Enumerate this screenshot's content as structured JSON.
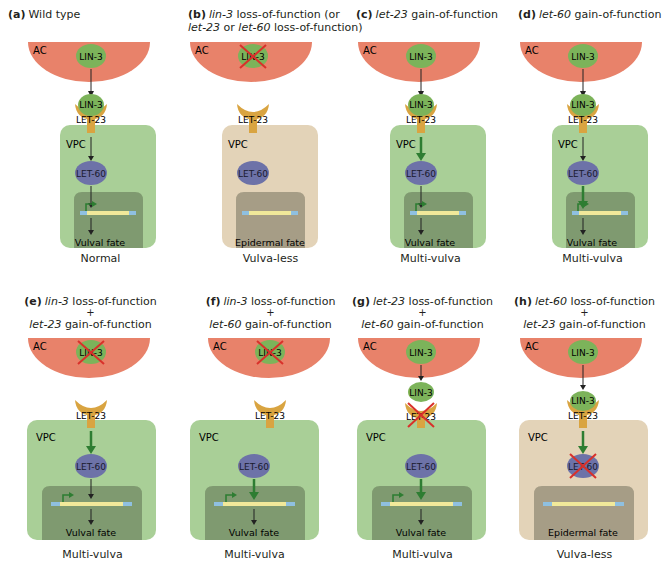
{
  "colors": {
    "ac_fill": "#e8826a",
    "lin3_fill": "#7cb35a",
    "let23_fill": "#d9a441",
    "let60_fill": "#6d72a8",
    "vpc_vulval": "#a9cf97",
    "vpc_epidermal": "#e3d3b8",
    "nucleus_vulval": "#7f9a70",
    "nucleus_epidermal": "#a69d86",
    "gene_bar": "#f1e99a",
    "gene_ends": "#8fc0e0",
    "promoter_arrow": "#2e7d32",
    "strong_arrow": "#2e7d32",
    "cross": "#d9302a"
  },
  "labels": {
    "ac": "AC",
    "vpc": "VPC",
    "lin3": "LIN-3",
    "let23": "LET-23",
    "let60": "LET-60",
    "plus": "+"
  },
  "panels": [
    {
      "id": "a",
      "letter": "(a)",
      "title_parts": [
        {
          "text": "Wild type",
          "italic": false
        }
      ],
      "fate": "Vulval fate",
      "outcome": "Normal"
    },
    {
      "id": "b",
      "letter": "(b)",
      "title_line1": [
        {
          "text": "lin-3",
          "italic": true
        },
        {
          "text": " loss-of-function (or",
          "italic": false
        }
      ],
      "title_line2": [
        {
          "text": "let-23",
          "italic": true
        },
        {
          "text": " or ",
          "italic": false
        },
        {
          "text": "let-60",
          "italic": true
        },
        {
          "text": " loss-of-function)",
          "italic": false
        }
      ],
      "fate": "Epidermal fate",
      "outcome": "Vulva-less"
    },
    {
      "id": "c",
      "letter": "(c)",
      "title_parts": [
        {
          "text": "let-23",
          "italic": true
        },
        {
          "text": " gain-of-function",
          "italic": false
        }
      ],
      "fate": "Vulval fate",
      "outcome": "Multi-vulva"
    },
    {
      "id": "d",
      "letter": "(d)",
      "title_parts": [
        {
          "text": "let-60",
          "italic": true
        },
        {
          "text": " gain-of-function",
          "italic": false
        }
      ],
      "fate": "Vulval fate",
      "outcome": "Multi-vulva"
    },
    {
      "id": "e",
      "letter": "(e)",
      "line1": [
        {
          "text": "lin-3",
          "italic": true
        },
        {
          "text": " loss-of-function",
          "italic": false
        }
      ],
      "line2": [
        {
          "text": "let-23",
          "italic": true
        },
        {
          "text": " gain-of-function",
          "italic": false
        }
      ],
      "fate": "Vulval fate",
      "outcome": "Multi-vulva"
    },
    {
      "id": "f",
      "letter": "(f)",
      "line1": [
        {
          "text": "lin-3",
          "italic": true
        },
        {
          "text": " loss-of-function",
          "italic": false
        }
      ],
      "line2": [
        {
          "text": "let-60",
          "italic": true
        },
        {
          "text": " gain-of-function",
          "italic": false
        }
      ],
      "fate": "Vulval fate",
      "outcome": "Multi-vulva"
    },
    {
      "id": "g",
      "letter": "(g)",
      "line1": [
        {
          "text": "let-23",
          "italic": true
        },
        {
          "text": " loss-of-function",
          "italic": false
        }
      ],
      "line2": [
        {
          "text": "let-60",
          "italic": true
        },
        {
          "text": " gain-of-function",
          "italic": false
        }
      ],
      "fate": "Vulval fate",
      "outcome": "Multi-vulva"
    },
    {
      "id": "h",
      "letter": "(h)",
      "line1": [
        {
          "text": "let-60",
          "italic": true
        },
        {
          "text": " loss-of-function",
          "italic": false
        }
      ],
      "line2": [
        {
          "text": "let-23",
          "italic": true
        },
        {
          "text": " gain-of-function",
          "italic": false
        }
      ],
      "fate": "Epidermal fate",
      "outcome": "Vulva-less"
    }
  ]
}
